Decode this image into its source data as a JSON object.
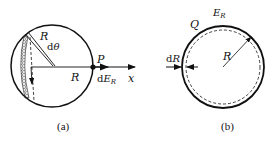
{
  "figure_a": {
    "caption": "(a)",
    "labels": {
      "radius_slant": "R",
      "dtheta_d": "d",
      "dtheta_theta": "θ",
      "radius_axis": "R",
      "point": "P",
      "field_d": "d",
      "field_E": "E",
      "field_sub": "R",
      "axis": "x"
    }
  },
  "figure_b": {
    "caption": "(b)",
    "labels": {
      "charge": "Q",
      "field_E": "E",
      "field_sub": "R",
      "thickness_d": "d",
      "thickness_R": "R",
      "radius": "R"
    }
  },
  "colors": {
    "stroke": "#111111",
    "background": "#ffffff"
  }
}
